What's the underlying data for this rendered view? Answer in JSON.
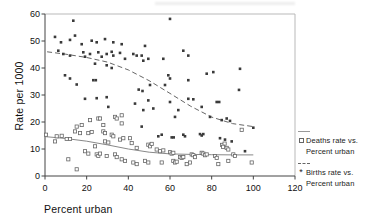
{
  "colors": {
    "axis": "#444444",
    "frame": "#b9b9b9",
    "tick_text": "#111111",
    "deaths_marker_stroke": "#666666",
    "births_marker_fill": "#3a3a3a",
    "trend_solid": "#888888",
    "trend_dashed": "#666666"
  },
  "legend": {
    "items": [
      {
        "line1": "Deaths rate vs.",
        "line2": "Percent urban",
        "marker": "open-square",
        "line_style": "solid"
      },
      {
        "line1": "Births rate vs.",
        "line2": "Percent urban",
        "marker": "asterisk",
        "line_style": "dashed"
      }
    ]
  },
  "chart_data": {
    "type": "scatter",
    "title": "",
    "xlabel": "Percent urban",
    "ylabel": "Rate per 1000",
    "xlim": [
      0,
      120
    ],
    "ylim": [
      0,
      60
    ],
    "x_ticks": [
      0,
      20,
      40,
      60,
      80,
      100,
      120
    ],
    "y_ticks": [
      0,
      10,
      20,
      30,
      40,
      50,
      60
    ],
    "grid": false,
    "legend_position": "right",
    "series": [
      {
        "name": "Deaths rate vs. Percent urban",
        "marker": "open-square",
        "points": [
          [
            15.2,
            18.3
          ],
          [
            17.6,
            18.9
          ],
          [
            21.6,
            20.7
          ],
          [
            25.6,
            21.3
          ],
          [
            26.4,
            21.3
          ],
          [
            33.6,
            21.9
          ],
          [
            34.4,
            21.3
          ],
          [
            36.8,
            22.5
          ],
          [
            28,
            18.9
          ],
          [
            36.8,
            19.5
          ],
          [
            0.5,
            15.3
          ],
          [
            5.6,
            14.7
          ],
          [
            8,
            14.9
          ],
          [
            4.8,
            12.8
          ],
          [
            10.4,
            13.7
          ],
          [
            12,
            13.7
          ],
          [
            16.8,
            15.9
          ],
          [
            14.4,
            16.5
          ],
          [
            20.8,
            15.9
          ],
          [
            22.4,
            16.3
          ],
          [
            28,
            16.5
          ],
          [
            28.8,
            15.9
          ],
          [
            32,
            15.3
          ],
          [
            32.8,
            14.7
          ],
          [
            36,
            13.5
          ],
          [
            37.6,
            14
          ],
          [
            28.8,
            12.8
          ],
          [
            30.4,
            12.4
          ],
          [
            24,
            11
          ],
          [
            19.2,
            9.2
          ],
          [
            20.8,
            8.3
          ],
          [
            24.8,
            8
          ],
          [
            25.6,
            7.4
          ],
          [
            26.4,
            8.3
          ],
          [
            29.6,
            7.4
          ],
          [
            33.6,
            8
          ],
          [
            34.4,
            7
          ],
          [
            36.8,
            6.2
          ],
          [
            38.4,
            5.6
          ],
          [
            11.2,
            6.2
          ],
          [
            15.2,
            2.5
          ],
          [
            40.8,
            14
          ],
          [
            41.6,
            12.2
          ],
          [
            44,
            10.4
          ],
          [
            49.6,
            11.6
          ],
          [
            50.4,
            11
          ],
          [
            51.2,
            11.9
          ],
          [
            53.6,
            9.8
          ],
          [
            55.2,
            9.2
          ],
          [
            56.8,
            9.5
          ],
          [
            60,
            8.8
          ],
          [
            60.8,
            8.3
          ],
          [
            61.6,
            8.6
          ],
          [
            64.8,
            7
          ],
          [
            65.6,
            6.7
          ],
          [
            66.4,
            7
          ],
          [
            70.4,
            8
          ],
          [
            71.2,
            7.7
          ],
          [
            72,
            7
          ],
          [
            75.2,
            8.6
          ],
          [
            76,
            8.3
          ],
          [
            76.8,
            7.7
          ],
          [
            77.6,
            8
          ],
          [
            42.4,
            5
          ],
          [
            44,
            4.4
          ],
          [
            48,
            5.6
          ],
          [
            49.6,
            5
          ],
          [
            56,
            5
          ],
          [
            61.6,
            5.6
          ],
          [
            62.4,
            5
          ],
          [
            63.2,
            5.3
          ],
          [
            68,
            4.4
          ],
          [
            69.6,
            5
          ],
          [
            94.4,
            17.1
          ],
          [
            85,
            11.5
          ],
          [
            86.2,
            12
          ],
          [
            85.5,
            10.8
          ],
          [
            87.2,
            10.4
          ],
          [
            88,
            9.8
          ],
          [
            90.4,
            8
          ],
          [
            91.2,
            7.4
          ],
          [
            81.6,
            7.4
          ],
          [
            82.4,
            6.7
          ],
          [
            88,
            5.6
          ],
          [
            99.2,
            5
          ],
          [
            83.2,
            4.4
          ]
        ],
        "trend": {
          "style": "solid",
          "points": [
            [
              0,
              14.6
            ],
            [
              10,
              13.9
            ],
            [
              20,
              12.9
            ],
            [
              30,
              11.5
            ],
            [
              40,
              10
            ],
            [
              50,
              8.8
            ],
            [
              60,
              8.2
            ],
            [
              70,
              8
            ],
            [
              80,
              7.9
            ],
            [
              90,
              7.8
            ],
            [
              100,
              7.8
            ]
          ]
        }
      },
      {
        "name": "Births rate vs. Percent urban",
        "marker": "asterisk",
        "points": [
          [
            13.6,
            57.5
          ],
          [
            4.8,
            51.5
          ],
          [
            7.7,
            49.5
          ],
          [
            12,
            50.4
          ],
          [
            14.4,
            52
          ],
          [
            17.6,
            48.8
          ],
          [
            22.4,
            50.1
          ],
          [
            24.8,
            49.5
          ],
          [
            28.8,
            50.7
          ],
          [
            32.8,
            49.5
          ],
          [
            36.8,
            48.8
          ],
          [
            6.4,
            46.4
          ],
          [
            8.8,
            45.2
          ],
          [
            12,
            44.6
          ],
          [
            18.4,
            45.8
          ],
          [
            19.2,
            44.2
          ],
          [
            21.6,
            45.2
          ],
          [
            25.6,
            45.8
          ],
          [
            27.2,
            44.2
          ],
          [
            29.6,
            45.2
          ],
          [
            32,
            46
          ],
          [
            32.8,
            44.6
          ],
          [
            36,
            45.6
          ],
          [
            38.4,
            43.4
          ],
          [
            24,
            41.6
          ],
          [
            29.6,
            41
          ],
          [
            32,
            40
          ],
          [
            9.6,
            37.3
          ],
          [
            12,
            36.1
          ],
          [
            23.2,
            35.5
          ],
          [
            24.4,
            35.5
          ],
          [
            15.2,
            33.9
          ],
          [
            60,
            58.2
          ],
          [
            48,
            48.2
          ],
          [
            44,
            44.6
          ],
          [
            46.4,
            44.6
          ],
          [
            42.4,
            45.2
          ],
          [
            47.2,
            42.7
          ],
          [
            49.6,
            43.4
          ],
          [
            56.8,
            43.4
          ],
          [
            66.4,
            46.4
          ],
          [
            68.8,
            44.6
          ],
          [
            59.2,
            37.3
          ],
          [
            60,
            36.1
          ],
          [
            57.6,
            33.7
          ],
          [
            50.4,
            33.7
          ],
          [
            68.8,
            35.5
          ],
          [
            77.6,
            37.9
          ],
          [
            80.8,
            38.5
          ],
          [
            45,
            32
          ],
          [
            46.8,
            31.5
          ],
          [
            93.6,
            39.7
          ],
          [
            93.1,
            31.9
          ],
          [
            19.2,
            28.6
          ],
          [
            24.8,
            28.8
          ],
          [
            29.6,
            29.2
          ],
          [
            30.4,
            25.6
          ],
          [
            43.2,
            26.8
          ],
          [
            49.6,
            28
          ],
          [
            52,
            25
          ],
          [
            47.2,
            24.4
          ],
          [
            60,
            27.4
          ],
          [
            64,
            24.4
          ],
          [
            68.8,
            28.6
          ],
          [
            71.2,
            28.4
          ],
          [
            75.2,
            25.6
          ],
          [
            62.4,
            21.9
          ],
          [
            79.2,
            21.9
          ],
          [
            46.4,
            18.3
          ],
          [
            54.4,
            14.7
          ],
          [
            56,
            15.3
          ],
          [
            60.8,
            14.3
          ],
          [
            61.8,
            14.3
          ],
          [
            66.4,
            15.3
          ],
          [
            67.2,
            14.7
          ],
          [
            74.4,
            15.5
          ],
          [
            75.2,
            15
          ],
          [
            76,
            15.5
          ],
          [
            82.4,
            27.4
          ],
          [
            83.6,
            27.4
          ],
          [
            84.8,
            20.7
          ],
          [
            87.2,
            21.3
          ],
          [
            88.8,
            20.4
          ],
          [
            100,
            17.9
          ],
          [
            84,
            14
          ],
          [
            86.4,
            13.5
          ],
          [
            89.6,
            12.8
          ],
          [
            96,
            9.2
          ]
        ],
        "trend": {
          "style": "dashed",
          "points": [
            [
              1,
              46
            ],
            [
              10,
              45.1
            ],
            [
              20,
              43.9
            ],
            [
              30,
              42.2
            ],
            [
              40,
              39.3
            ],
            [
              50,
              35.3
            ],
            [
              60,
              30.6
            ],
            [
              70,
              25.8
            ],
            [
              80,
              21.8
            ],
            [
              90,
              19.4
            ],
            [
              100,
              18.3
            ]
          ]
        }
      }
    ]
  }
}
